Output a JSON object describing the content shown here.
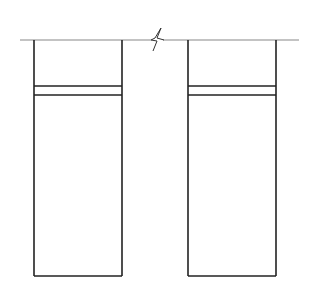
{
  "diagram": {
    "type": "technical-drawing",
    "colors": {
      "background": "#ffffff",
      "baseline": "#888888",
      "outline": "#222222"
    },
    "baseline": {
      "y": 40,
      "x1": 20,
      "x2": 299,
      "break_symbol_x": 155
    },
    "elements": [
      {
        "id": "left",
        "x": 34,
        "top": 40,
        "width": 88,
        "bottom": 276,
        "band_top": 86,
        "band_bottom": 95
      },
      {
        "id": "right",
        "x": 188,
        "top": 40,
        "width": 88,
        "bottom": 276,
        "band_top": 86,
        "band_bottom": 95
      }
    ]
  }
}
